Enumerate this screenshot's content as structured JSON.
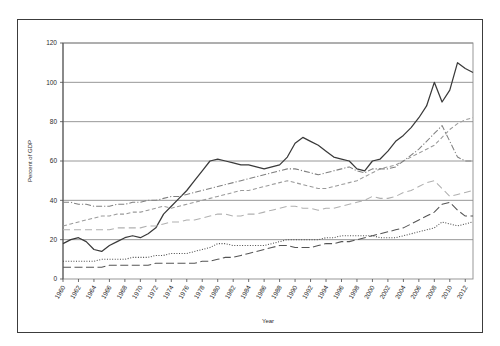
{
  "chart_data": {
    "type": "line",
    "title": "",
    "xlabel": "Year",
    "ylabel": "Percent of GDP",
    "xlim": [
      1960,
      2013
    ],
    "ylim": [
      0,
      120
    ],
    "ytick_step": 20,
    "yticks": [
      0,
      20,
      40,
      60,
      80,
      100,
      120
    ],
    "xtick_step": 2,
    "grid": "horizontal",
    "legend_position": "bottom",
    "categories": [
      1960,
      1961,
      1962,
      1963,
      1964,
      1965,
      1966,
      1967,
      1968,
      1969,
      1970,
      1971,
      1972,
      1973,
      1974,
      1975,
      1976,
      1977,
      1978,
      1979,
      1980,
      1981,
      1982,
      1983,
      1984,
      1985,
      1986,
      1987,
      1988,
      1989,
      1990,
      1991,
      1992,
      1993,
      1994,
      1995,
      1996,
      1997,
      1998,
      1999,
      2000,
      2001,
      2002,
      2003,
      2004,
      2005,
      2006,
      2007,
      2008,
      2009,
      2010,
      2011,
      2012,
      2013
    ],
    "xtick_labels": [
      "1960",
      "1962",
      "1964",
      "1966",
      "1968",
      "1970",
      "1972",
      "1974",
      "1976",
      "1978",
      "1980",
      "1982",
      "1984",
      "1986",
      "1988",
      "1990",
      "1992",
      "1994",
      "1996",
      "1998",
      "2000",
      "2002",
      "2004",
      "2006",
      "2008",
      "2010",
      "2012"
    ],
    "series": [
      {
        "name": "Korea",
        "style": "solid",
        "color": "#3a3a3a",
        "values": [
          18,
          20,
          21,
          19,
          15,
          14,
          17,
          19,
          21,
          22,
          21,
          23,
          26,
          33,
          37,
          41,
          45,
          50,
          55,
          60,
          61,
          60,
          59,
          58,
          58,
          57,
          56,
          57,
          58,
          62,
          69,
          72,
          70,
          68,
          65,
          62,
          61,
          60,
          56,
          55,
          60,
          61,
          65,
          70,
          73,
          77,
          82,
          88,
          100,
          90,
          96,
          110,
          107,
          105
        ]
      },
      {
        "name": "Japan",
        "style": "dashed",
        "color": "#9a9a9a",
        "values": [
          27,
          28,
          29,
          30,
          31,
          32,
          32,
          33,
          33,
          34,
          34,
          35,
          36,
          37,
          36,
          37,
          38,
          39,
          40,
          41,
          42,
          43,
          44,
          45,
          45,
          46,
          47,
          48,
          49,
          50,
          49,
          48,
          47,
          46,
          46,
          47,
          48,
          49,
          50,
          52,
          54,
          56,
          57,
          58,
          60,
          62,
          64,
          66,
          68,
          72,
          76,
          79,
          81,
          82
        ]
      },
      {
        "name": "China",
        "style": "longdash",
        "color": "#555555",
        "values": [
          6,
          6,
          6,
          6,
          6,
          6,
          7,
          7,
          7,
          7,
          7,
          7,
          8,
          8,
          8,
          8,
          8,
          8,
          9,
          9,
          10,
          11,
          11,
          12,
          13,
          14,
          15,
          16,
          17,
          17,
          16,
          16,
          16,
          17,
          18,
          18,
          19,
          19,
          20,
          21,
          22,
          23,
          24,
          25,
          26,
          28,
          30,
          32,
          34,
          38,
          39,
          35,
          32,
          32
        ]
      },
      {
        "name": "US",
        "style": "dotted",
        "color": "#4a4a4a",
        "values": [
          9,
          9,
          9,
          9,
          9,
          10,
          10,
          10,
          10,
          11,
          11,
          11,
          12,
          12,
          13,
          13,
          13,
          14,
          15,
          16,
          18,
          18,
          17,
          17,
          17,
          17,
          17,
          18,
          19,
          20,
          20,
          20,
          20,
          20,
          21,
          21,
          22,
          22,
          22,
          22,
          22,
          21,
          21,
          21,
          22,
          23,
          24,
          25,
          26,
          29,
          28,
          27,
          28,
          29
        ]
      },
      {
        "name": "EU",
        "style": "dashdot",
        "color": "#808080",
        "values": [
          39,
          39,
          38,
          38,
          37,
          37,
          37,
          38,
          38,
          39,
          39,
          40,
          40,
          41,
          42,
          42,
          43,
          44,
          45,
          46,
          47,
          48,
          49,
          50,
          51,
          52,
          53,
          54,
          55,
          56,
          56,
          55,
          54,
          53,
          54,
          55,
          56,
          57,
          55,
          54,
          56,
          56,
          56,
          57,
          60,
          63,
          66,
          70,
          74,
          78,
          70,
          62,
          60,
          60
        ]
      },
      {
        "name": "World",
        "style": "longdash2",
        "color": "#b0b0b0",
        "values": [
          25,
          25,
          25,
          25,
          25,
          25,
          25,
          26,
          26,
          26,
          26,
          27,
          27,
          28,
          29,
          29,
          30,
          30,
          31,
          32,
          33,
          33,
          32,
          32,
          33,
          33,
          34,
          35,
          36,
          37,
          37,
          36,
          36,
          35,
          36,
          36,
          37,
          38,
          39,
          40,
          42,
          41,
          41,
          42,
          44,
          45,
          47,
          49,
          50,
          46,
          42,
          43,
          44,
          45
        ]
      }
    ]
  },
  "legend": {
    "items": [
      {
        "label": "Korea"
      },
      {
        "label": "Japan"
      },
      {
        "label": "China"
      },
      {
        "label": "US"
      },
      {
        "label": "EU"
      },
      {
        "label": "World"
      }
    ]
  }
}
